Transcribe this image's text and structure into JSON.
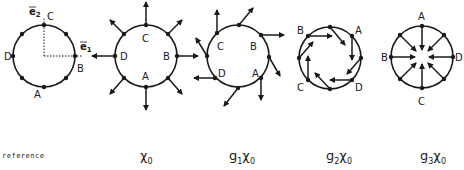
{
  "diagram": {
    "type": "group-action-on-vector-fields",
    "panels": [
      {
        "id": "reference",
        "caption": "reference",
        "center": [
          44,
          56
        ],
        "radius": 31,
        "labels": [
          {
            "text": "C",
            "pos": [
              50,
              22
            ]
          },
          {
            "text": "B",
            "pos": [
              78,
              72
            ]
          },
          {
            "text": "A",
            "pos": [
              38,
              97
            ]
          },
          {
            "text": "D",
            "pos": [
              5,
              61
            ]
          }
        ],
        "axes": [
          {
            "label": "e2",
            "direction": "up"
          },
          {
            "label": "e1",
            "direction": "right"
          }
        ],
        "arrows": "none"
      },
      {
        "id": "chi0",
        "caption_base": "χ",
        "caption_sub": "0",
        "caption_prefix": "",
        "caption_prefix_sub": "",
        "center": [
          146,
          56
        ],
        "radius": 31,
        "labels": [
          {
            "text": "C",
            "pos": [
              143,
              42
            ]
          },
          {
            "text": "B",
            "pos": [
              163,
              62
            ]
          },
          {
            "text": "A",
            "pos": [
              143,
              82
            ]
          },
          {
            "text": "D",
            "pos": [
              120,
              62
            ]
          }
        ],
        "arrows": "radial-outward"
      },
      {
        "id": "g1chi0",
        "caption_prefix": "g",
        "caption_prefix_sub": "1",
        "caption_base": "χ",
        "caption_sub": "0",
        "center": [
          238,
          56
        ],
        "radius": 31,
        "labels": [
          {
            "text": "C",
            "pos": [
              217,
              50
            ]
          },
          {
            "text": "B",
            "pos": [
              250,
              50
            ]
          },
          {
            "text": "A",
            "pos": [
              252,
              76
            ]
          },
          {
            "text": "D",
            "pos": [
              219,
              76
            ]
          }
        ],
        "arrows": "rotated-outward"
      },
      {
        "id": "g2chi0",
        "caption_prefix": "g",
        "caption_prefix_sub": "2",
        "caption_base": "χ",
        "caption_sub": "0",
        "center": [
          330,
          58
        ],
        "radius": 31,
        "labels": [
          {
            "text": "B",
            "pos": [
              298,
              35
            ]
          },
          {
            "text": "A",
            "pos": [
              357,
              35
            ]
          },
          {
            "text": "C",
            "pos": [
              298,
              92
            ]
          },
          {
            "text": "D",
            "pos": [
              357,
              92
            ]
          }
        ],
        "arrows": "tangential-clockwise"
      },
      {
        "id": "g3chi0",
        "caption_prefix": "g",
        "caption_prefix_sub": "3",
        "caption_base": "χ",
        "caption_sub": "0",
        "center": [
          422,
          57
        ],
        "radius": 31,
        "labels": [
          {
            "text": "A",
            "pos": [
              421,
              21
            ]
          },
          {
            "text": "B",
            "pos": [
              384,
              61
            ]
          },
          {
            "text": "D",
            "pos": [
              457,
              61
            ]
          },
          {
            "text": "C",
            "pos": [
              421,
              103
            ]
          }
        ],
        "arrows": "radial-inward"
      }
    ],
    "captions": {
      "reference": "reference",
      "chi0": {
        "base": "χ",
        "sub": "0"
      },
      "g1chi0": {
        "prefix": "g",
        "prefix_sub": "1",
        "base": "χ",
        "sub": "0"
      },
      "g2chi0": {
        "prefix": "g",
        "prefix_sub": "2",
        "base": "χ",
        "sub": "0"
      },
      "g3chi0": {
        "prefix": "g",
        "prefix_sub": "3",
        "base": "χ",
        "sub": "0"
      }
    },
    "axis_labels": {
      "e1": "e",
      "e1_sub": "1",
      "e2": "e",
      "e2_sub": "2"
    },
    "colors": {
      "stroke": "#1a1a1a",
      "background": "#ffffff"
    }
  }
}
